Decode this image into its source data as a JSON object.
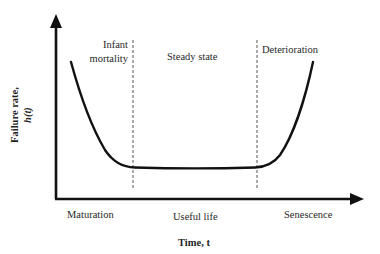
{
  "diagram": {
    "type": "bathtub-curve",
    "axes": {
      "y_label_line1": "Failure rate,",
      "y_label_line2": "h(t)",
      "x_label": "Time, t"
    },
    "phase_labels_top": {
      "infant_line1": "Infant",
      "infant_line2": "mortality",
      "steady": "Steady state",
      "deterioration": "Deterioration"
    },
    "phase_labels_bottom": {
      "maturation": "Maturation",
      "useful_life": "Useful life",
      "senescence": "Senescence"
    },
    "colors": {
      "ink": "#111111",
      "dashed": "#555555",
      "background": "#ffffff"
    }
  }
}
